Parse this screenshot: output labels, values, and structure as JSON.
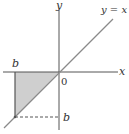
{
  "diagram": {
    "axes": {
      "x_label": "x",
      "y_label": "y",
      "origin_label": "0"
    },
    "line": {
      "label": "y = x",
      "color": "#8a8a8a"
    },
    "point_labels": {
      "top_b": "b",
      "right_b": "b"
    },
    "region": {
      "fill": "#cfcfcf",
      "description": "triangle between x-axis, x=b, and y=x for b<0"
    },
    "colors": {
      "axis": "#555555",
      "edge": "#555555",
      "dashed": "#555555"
    }
  }
}
